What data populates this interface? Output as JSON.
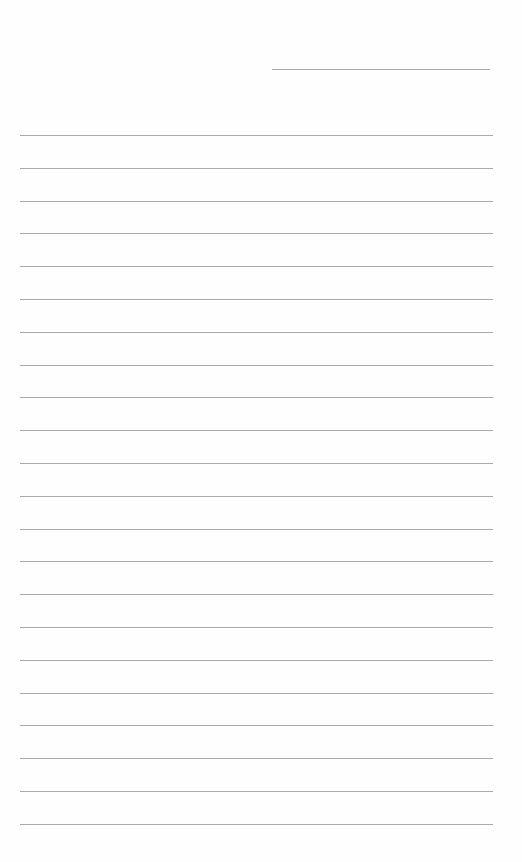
{
  "page": {
    "type": "blank lined notepaper",
    "header_line": {
      "present": true
    },
    "ruled_lines": {
      "count": 22,
      "first_y": 135,
      "spacing": 32.8
    },
    "line_color": "#a9a9a9",
    "background": "#fefefe"
  }
}
